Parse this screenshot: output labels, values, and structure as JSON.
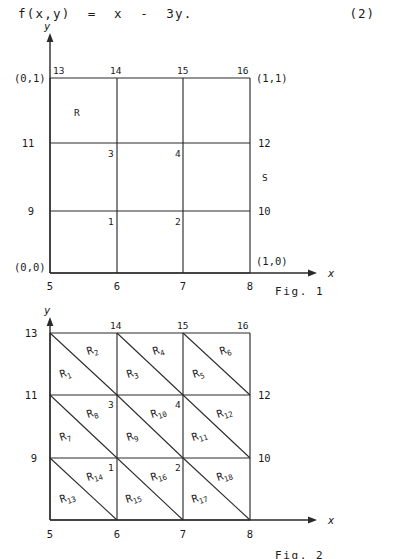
{
  "equation": {
    "text": "f(x,y)  =  x  -  3y.",
    "number": "(2)"
  },
  "figure1": {
    "caption": "Fig. 1",
    "axis_x_label": "x",
    "axis_y_label": "y",
    "region_label": "R",
    "boundary_label": "S",
    "corner_labels": {
      "bottom_left": "(0,0)",
      "top_left": "(0,1)",
      "top_right": "(1,1)",
      "bottom_right": "(1,0)"
    },
    "x_ticks": [
      "5",
      "6",
      "7",
      "8"
    ],
    "left_node_labels": [
      "13",
      "11",
      "9"
    ],
    "right_node_labels": [
      "16",
      "12",
      "10"
    ],
    "top_node_labels": [
      "13",
      "14",
      "15",
      "16"
    ],
    "interior_nodes": [
      "1",
      "2",
      "3",
      "4"
    ],
    "grid_x": [
      5,
      6,
      7,
      8
    ],
    "grid_y": [
      0,
      1
    ]
  },
  "figure2": {
    "caption": "Fig. 2",
    "axis_x_label": "x",
    "axis_y_label": "y",
    "x_ticks": [
      "5",
      "6",
      "7",
      "8"
    ],
    "left_node_labels": [
      "13",
      "11",
      "9"
    ],
    "right_node_labels": [
      "16",
      "12",
      "10"
    ],
    "top_node_labels": [
      "14",
      "15",
      "16"
    ],
    "interior_nodes": [
      "1",
      "2",
      "3",
      "4"
    ],
    "triangles": [
      "R1",
      "R2",
      "R3",
      "R4",
      "R5",
      "R6",
      "R7",
      "R8",
      "R9",
      "R10",
      "R11",
      "R12",
      "R13",
      "R14",
      "R15",
      "R16",
      "R17",
      "R18"
    ],
    "triangle_base": "R",
    "triangle_subscripts": [
      "1",
      "2",
      "3",
      "4",
      "5",
      "6",
      "7",
      "8",
      "9",
      "10",
      "11",
      "12",
      "13",
      "14",
      "15",
      "16",
      "17",
      "18"
    ]
  }
}
